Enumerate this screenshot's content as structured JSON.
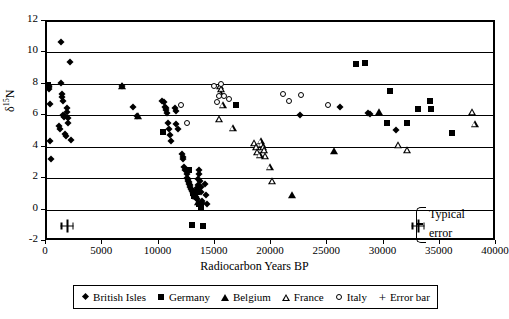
{
  "chart_data": {
    "type": "scatter",
    "title": "",
    "xlabel": "Radiocarbon Years BP",
    "ylabel": "δ¹⁵N",
    "ylabel_base": "δ",
    "ylabel_sup": "15",
    "ylabel_tail": "N",
    "xlim": [
      0,
      40000
    ],
    "ylim": [
      -2,
      12
    ],
    "xticks": [
      0,
      5000,
      10000,
      15000,
      20000,
      25000,
      30000,
      35000,
      40000
    ],
    "yticks": [
      -2,
      0,
      2,
      4,
      6,
      8,
      10,
      12
    ],
    "xticklabels": [
      "0",
      "5000",
      "10000",
      "15000",
      "20000",
      "25000",
      "30000",
      "35000",
      "40000"
    ],
    "yticklabels": [
      "-2",
      "0",
      "2",
      "4",
      "6",
      "8",
      "10",
      "12"
    ],
    "grid": "horizontal",
    "legend_position": "bottom",
    "annotations": [
      {
        "name": "typical-error",
        "line1": "Typical",
        "line2": "error"
      }
    ],
    "series": [
      {
        "name": "British Isles",
        "marker": "filled-diamond",
        "color": "#000000",
        "points": [
          [
            150,
            7.95
          ],
          [
            180,
            7.85
          ],
          [
            200,
            7.75
          ],
          [
            250,
            4.45
          ],
          [
            300,
            6.8
          ],
          [
            330,
            3.3
          ],
          [
            1200,
            10.7
          ],
          [
            1250,
            8.1
          ],
          [
            1300,
            7.4
          ],
          [
            1350,
            7.25
          ],
          [
            1400,
            7.0
          ],
          [
            1450,
            6.1
          ],
          [
            1480,
            5.95
          ],
          [
            1500,
            6.0
          ],
          [
            1100,
            5.4
          ],
          [
            1150,
            5.2
          ],
          [
            1600,
            4.85
          ],
          [
            1700,
            4.75
          ],
          [
            1750,
            6.55
          ],
          [
            1800,
            6.25
          ],
          [
            1850,
            5.9
          ],
          [
            1900,
            5.55
          ],
          [
            2000,
            9.45
          ],
          [
            2100,
            4.5
          ],
          [
            6700,
            7.9
          ],
          [
            7600,
            6.6
          ],
          [
            8000,
            6.0
          ],
          [
            10200,
            7.0
          ],
          [
            10400,
            6.9
          ],
          [
            10500,
            6.6
          ],
          [
            10550,
            6.5
          ],
          [
            10600,
            6.4
          ],
          [
            10700,
            6.2
          ],
          [
            10750,
            5.6
          ],
          [
            10800,
            5.2
          ],
          [
            10900,
            4.8
          ],
          [
            11000,
            4.4
          ],
          [
            11400,
            6.55
          ],
          [
            11450,
            6.35
          ],
          [
            11500,
            5.5
          ],
          [
            11600,
            5.2
          ],
          [
            12000,
            3.6
          ],
          [
            12050,
            3.4
          ],
          [
            12100,
            3.3
          ],
          [
            12200,
            2.8
          ],
          [
            12300,
            2.6
          ],
          [
            12400,
            2.3
          ],
          [
            12450,
            2.1
          ],
          [
            12500,
            2.0
          ],
          [
            12550,
            1.9
          ],
          [
            12600,
            1.8
          ],
          [
            12650,
            1.7
          ],
          [
            12700,
            1.6
          ],
          [
            12750,
            1.5
          ],
          [
            12800,
            1.4
          ],
          [
            12850,
            1.3
          ],
          [
            12900,
            1.25
          ],
          [
            12950,
            1.2
          ],
          [
            13000,
            1.1
          ],
          [
            13050,
            1.0
          ],
          [
            13100,
            0.95
          ],
          [
            13150,
            0.9
          ],
          [
            13200,
            0.85
          ],
          [
            13250,
            0.8
          ],
          [
            13300,
            0.75
          ],
          [
            13350,
            1.45
          ],
          [
            13400,
            1.6
          ],
          [
            13450,
            2.0
          ],
          [
            13500,
            2.3
          ],
          [
            13550,
            2.6
          ],
          [
            13600,
            1.9
          ],
          [
            13650,
            1.5
          ],
          [
            13700,
            1.2
          ],
          [
            13750,
            0.6
          ],
          [
            13800,
            0.5
          ],
          [
            14000,
            1.7
          ],
          [
            14100,
            1.0
          ],
          [
            14200,
            0.4
          ],
          [
            22500,
            6.1
          ],
          [
            26000,
            6.6
          ],
          [
            28500,
            6.2
          ],
          [
            28700,
            6.15
          ],
          [
            31000,
            5.1
          ]
        ]
      },
      {
        "name": "Germany",
        "marker": "filled-square",
        "color": "#000000",
        "points": [
          [
            120,
            8.0
          ],
          [
            10300,
            5.0
          ],
          [
            12600,
            2.6
          ],
          [
            13000,
            1.1
          ],
          [
            13100,
            0.9
          ],
          [
            13300,
            1.2
          ],
          [
            13500,
            0.45
          ],
          [
            13700,
            0.2
          ],
          [
            12900,
            -0.9
          ],
          [
            13900,
            -0.95
          ],
          [
            16800,
            6.75
          ],
          [
            27500,
            9.3
          ],
          [
            28300,
            9.4
          ],
          [
            30500,
            7.6
          ],
          [
            30200,
            5.55
          ],
          [
            33000,
            6.45
          ],
          [
            34000,
            7.0
          ],
          [
            34100,
            6.45
          ],
          [
            32000,
            5.6
          ],
          [
            36000,
            4.95
          ]
        ]
      },
      {
        "name": "Belgium",
        "marker": "filled-triangle",
        "color": "#000000",
        "points": [
          [
            6700,
            7.9
          ],
          [
            8100,
            6.0
          ],
          [
            13200,
            0.9
          ],
          [
            13400,
            0.55
          ],
          [
            21800,
            1.0
          ],
          [
            25500,
            3.8
          ],
          [
            29500,
            6.25
          ]
        ]
      },
      {
        "name": "France",
        "marker": "open-triangle",
        "color": "#000000",
        "points": [
          [
            15400,
            7.95
          ],
          [
            15500,
            7.75
          ],
          [
            15450,
            7.4
          ],
          [
            15600,
            6.7
          ],
          [
            15300,
            5.85
          ],
          [
            16500,
            5.25
          ],
          [
            18400,
            4.3
          ],
          [
            18600,
            4.05
          ],
          [
            18700,
            3.75
          ],
          [
            19000,
            4.4
          ],
          [
            19100,
            4.25
          ],
          [
            19200,
            4.05
          ],
          [
            19300,
            3.85
          ],
          [
            19400,
            3.5
          ],
          [
            18900,
            3.55
          ],
          [
            19800,
            2.8
          ],
          [
            20000,
            1.9
          ],
          [
            31200,
            4.15
          ],
          [
            32000,
            3.85
          ],
          [
            37800,
            6.25
          ],
          [
            38000,
            5.5
          ]
        ]
      },
      {
        "name": "Italy",
        "marker": "open-circle",
        "color": "#000000",
        "points": [
          [
            11900,
            6.7
          ],
          [
            12400,
            5.6
          ],
          [
            14800,
            7.95
          ],
          [
            15500,
            8.05
          ],
          [
            15300,
            7.3
          ],
          [
            15700,
            7.3
          ],
          [
            16200,
            7.1
          ],
          [
            15100,
            6.9
          ],
          [
            21000,
            7.4
          ],
          [
            21500,
            7.0
          ],
          [
            22600,
            7.35
          ],
          [
            25000,
            6.7
          ]
        ]
      },
      {
        "name": "Error bar",
        "marker": "plus",
        "color": "#000000",
        "points": [
          [
            1800,
            -0.95
          ],
          [
            33000,
            -0.95
          ]
        ]
      }
    ],
    "legend": [
      {
        "label": "British Isles",
        "marker": "filled-diamond"
      },
      {
        "label": "Germany",
        "marker": "filled-square"
      },
      {
        "label": "Belgium",
        "marker": "filled-triangle"
      },
      {
        "label": "France",
        "marker": "open-triangle"
      },
      {
        "label": "Italy",
        "marker": "open-circle"
      },
      {
        "label": "Error bar",
        "marker": "plus"
      }
    ]
  }
}
